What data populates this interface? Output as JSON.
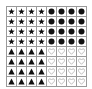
{
  "header": {
    "text": ""
  },
  "grid": {
    "rows": 8,
    "cols": 8,
    "line_color": "#9a9a9a",
    "symbol_color": "#111111",
    "outline_color": "#9a9a9a",
    "cells": [
      [
        "star",
        "star",
        "star",
        "star",
        "circle",
        "circle",
        "circle",
        "circle"
      ],
      [
        "star",
        "star",
        "star",
        "star",
        "circle",
        "circle",
        "circle",
        "circle"
      ],
      [
        "star",
        "star",
        "star",
        "star",
        "circle",
        "circle",
        "circle",
        "circle"
      ],
      [
        "star",
        "star",
        "star",
        "star",
        "circle",
        "circle",
        "circle",
        "circle"
      ],
      [
        "triangle",
        "triangle",
        "triangle",
        "triangle",
        "heart-outline",
        "heart-outline",
        "heart-outline",
        "heart-outline"
      ],
      [
        "triangle",
        "triangle",
        "triangle",
        "triangle",
        "heart-outline",
        "heart-outline",
        "heart-outline",
        "heart-outline"
      ],
      [
        "triangle",
        "triangle",
        "triangle",
        "triangle",
        "heart-outline",
        "heart-outline",
        "heart-outline",
        "heart-outline"
      ],
      [
        "triangle",
        "triangle",
        "triangle",
        "triangle",
        "heart-outline",
        "heart-outline",
        "heart-outline",
        "heart-outline"
      ]
    ]
  }
}
